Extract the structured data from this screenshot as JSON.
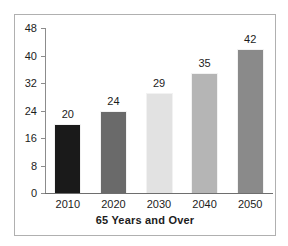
{
  "chart_data": {
    "type": "bar",
    "title": "65 Years and Over",
    "xlabel": "",
    "ylabel": "",
    "categories": [
      "2010",
      "2020",
      "2030",
      "2040",
      "2050"
    ],
    "values": [
      20,
      24,
      29,
      35,
      42
    ],
    "value_labels": [
      "20",
      "24",
      "29",
      "35",
      "42"
    ],
    "ylim": [
      0,
      48
    ],
    "ytick_labels": [
      "48",
      "40",
      "32",
      "24",
      "16",
      "8",
      "0"
    ],
    "ytick_values": [
      48,
      40,
      32,
      24,
      16,
      8,
      0
    ],
    "grid": false,
    "legend": "none",
    "series": [
      {
        "name": "65 Years and Over",
        "values": [
          20,
          24,
          29,
          35,
          42
        ]
      }
    ],
    "bar_colors": [
      "#1a1a1a",
      "#6a6a6a",
      "#e2e2e2",
      "#b5b5b5",
      "#8a8a8a"
    ],
    "axis_color": "#6e6e6e",
    "frame_color": "#b0b0b0",
    "text_color": "#1c1c1c",
    "background": "#ffffff"
  },
  "ticks": [
    {
      "label": "48",
      "value": 48
    },
    {
      "label": "40",
      "value": 40
    },
    {
      "label": "32",
      "value": 32
    },
    {
      "label": "24",
      "value": 24
    },
    {
      "label": "16",
      "value": 16
    },
    {
      "label": "8",
      "value": 8
    },
    {
      "label": "0",
      "value": 0
    }
  ],
  "bars": [
    {
      "category": "2010",
      "label": "20",
      "value": 20,
      "color": "#1a1a1a"
    },
    {
      "category": "2020",
      "label": "24",
      "value": 24,
      "color": "#6a6a6a"
    },
    {
      "category": "2030",
      "label": "29",
      "value": 29,
      "color": "#e2e2e2"
    },
    {
      "category": "2040",
      "label": "35",
      "value": 35,
      "color": "#b5b5b5"
    },
    {
      "category": "2050",
      "label": "42",
      "value": 42,
      "color": "#8a8a8a"
    }
  ],
  "title": "65 Years and Over"
}
